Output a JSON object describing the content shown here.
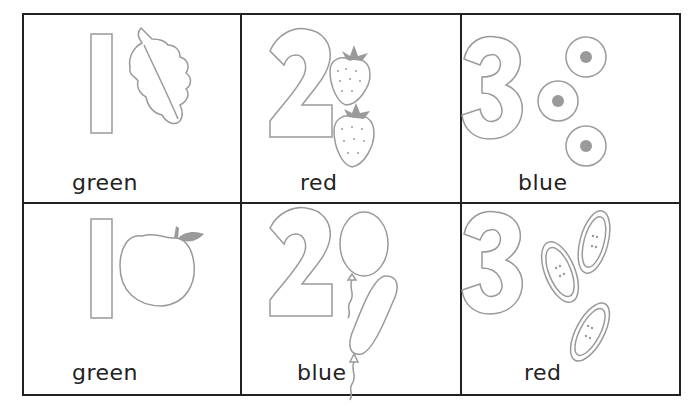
{
  "worksheet": {
    "cells": [
      {
        "number": "1",
        "object": "leaf",
        "count": 1,
        "color_word": "green"
      },
      {
        "number": "2",
        "object": "strawberry",
        "count": 2,
        "color_word": "red"
      },
      {
        "number": "3",
        "object": "flower",
        "count": 3,
        "color_word": "blue"
      },
      {
        "number": "1",
        "object": "apple",
        "count": 1,
        "color_word": "green"
      },
      {
        "number": "2",
        "object": "balloon",
        "count": 2,
        "color_word": "blue"
      },
      {
        "number": "3",
        "object": "button",
        "count": 3,
        "color_word": "red"
      }
    ]
  }
}
